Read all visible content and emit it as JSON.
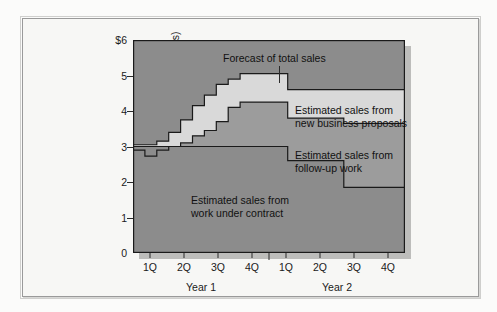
{
  "chart_data": {
    "type": "area",
    "title": "",
    "xlabel": "",
    "ylabel": "Estimated sales ($millions)",
    "ylim": [
      0,
      6
    ],
    "ytick_labels": [
      "$6",
      "5",
      "4",
      "3",
      "2",
      "1",
      "0"
    ],
    "ytick_values": [
      6,
      5,
      4,
      3,
      2,
      1,
      0
    ],
    "grid": false,
    "legend_position": "inline-annotations",
    "x_tick_labels": [
      "1Q",
      "2Q",
      "3Q",
      "4Q",
      "1Q",
      "2Q",
      "3Q",
      "4Q"
    ],
    "x_group_labels": [
      "Year 1",
      "Year 2"
    ],
    "x_domain": [
      0,
      8
    ],
    "annotations": [
      "Forecast of total sales",
      "Estimated sales from new business proposals",
      "Estimated sales from follow-up work",
      "Estimated sales from work under contract"
    ],
    "series": [
      {
        "name": "Estimated sales from work under contract",
        "color": "#8c8c8c",
        "step_x": [
          0.0,
          0.35,
          0.7,
          1.05,
          1.4,
          1.75,
          2.1,
          2.45,
          2.8,
          3.15,
          3.5,
          4.55,
          6.2,
          8.0
        ],
        "step_y": [
          3.0,
          3.0,
          3.0,
          3.0,
          3.0,
          3.0,
          3.0,
          3.0,
          3.0,
          3.0,
          3.0,
          2.6,
          1.85,
          1.85
        ]
      },
      {
        "name": "Estimated sales from follow-up work",
        "color": "#9c9c9c",
        "cumulative_top_x": [
          0.0,
          0.35,
          0.7,
          1.05,
          1.4,
          1.75,
          2.1,
          2.45,
          2.8,
          3.15,
          3.5,
          4.55,
          6.2,
          8.0
        ],
        "cumulative_top_y": [
          2.9,
          2.73,
          2.9,
          3.0,
          3.1,
          3.3,
          3.45,
          3.7,
          4.1,
          4.25,
          4.25,
          3.8,
          3.65,
          3.65
        ]
      },
      {
        "name": "Estimated sales from new business proposals",
        "color": "#d9d9d9",
        "cumulative_top_x": [
          0.0,
          0.35,
          0.7,
          1.05,
          1.4,
          1.75,
          2.1,
          2.45,
          2.8,
          3.15,
          3.5,
          4.55,
          6.2,
          8.0
        ],
        "cumulative_top_y": [
          3.05,
          3.05,
          3.15,
          3.4,
          3.75,
          4.15,
          4.45,
          4.75,
          4.9,
          5.05,
          5.05,
          4.6,
          4.6,
          4.6
        ]
      }
    ],
    "background_color": "#8c8c8c",
    "plot_border_color": "#1a1a1a"
  },
  "axis": {
    "y_title": "Estimated sales ($millions)",
    "y_ticks": [
      {
        "label": "$6"
      },
      {
        "label": "5"
      },
      {
        "label": "4"
      },
      {
        "label": "3"
      },
      {
        "label": "2"
      },
      {
        "label": "1"
      },
      {
        "label": "0"
      }
    ],
    "x_ticks": [
      {
        "label": "1Q"
      },
      {
        "label": "2Q"
      },
      {
        "label": "3Q"
      },
      {
        "label": "4Q"
      },
      {
        "label": "1Q"
      },
      {
        "label": "2Q"
      },
      {
        "label": "3Q"
      },
      {
        "label": "4Q"
      }
    ],
    "x_groups": [
      {
        "label": "Year 1"
      },
      {
        "label": "Year 2"
      }
    ]
  },
  "annotations": {
    "forecast": "Forecast of total sales",
    "new_business_line1": "Estimated sales from",
    "new_business_line2": "new business proposals",
    "follow_up_line1": "Estimated sales from",
    "follow_up_line2": "follow-up work",
    "contract_line1": "Estimated sales from",
    "contract_line2": "work under contract"
  }
}
